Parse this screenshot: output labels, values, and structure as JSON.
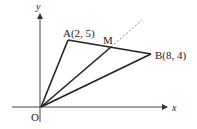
{
  "diagram": {
    "type": "coordinate-geometry",
    "axes": {
      "x_label": "x",
      "y_label": "y",
      "origin_label": "O"
    },
    "points": {
      "A": {
        "label": "A(2, 5)",
        "coords": [
          2,
          5
        ]
      },
      "B": {
        "label": "B(8, 4)",
        "coords": [
          8,
          4
        ]
      },
      "M": {
        "label": "M",
        "description": "midpoint of AB"
      },
      "O": {
        "label": "O",
        "coords": [
          0,
          0
        ]
      }
    },
    "segments": [
      "OA",
      "AB",
      "OB",
      "OM"
    ],
    "dashed_extension": "OM extended beyond M",
    "colors": {
      "stroke": "#222222",
      "dashed": "#888888",
      "background": "#ffffff"
    }
  }
}
